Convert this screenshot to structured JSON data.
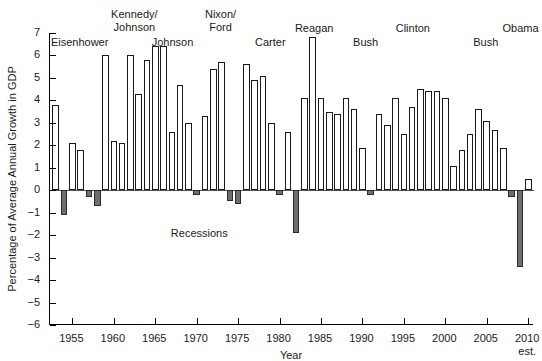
{
  "chart_data": {
    "type": "bar",
    "title": "",
    "xlabel": "Year",
    "ylabel": "Percentage of Average Annual Growth in GDP",
    "ylim": [
      -6,
      7
    ],
    "xlim": [
      1952.3,
      2010.7
    ],
    "yticks": [
      7,
      6,
      5,
      4,
      3,
      2,
      1,
      0,
      -1,
      -2,
      -3,
      -4,
      -5,
      -6
    ],
    "ytick_labels": [
      "7",
      "6",
      "5",
      "4",
      "3",
      "2",
      "1",
      "0",
      "−1",
      "−2",
      "−3",
      "−4",
      "−5",
      "−6"
    ],
    "xticks": [
      1955,
      1960,
      1965,
      1970,
      1975,
      1980,
      1985,
      1990,
      1995,
      2000,
      2005,
      2010
    ],
    "xtick_labels": [
      "1955",
      "1960",
      "1965",
      "1970",
      "1975",
      "1980",
      "1985",
      "1990",
      "1995",
      "2000",
      "2005",
      "2010"
    ],
    "xtick_sublabel": {
      "1955": "",
      "2010": "est."
    },
    "grid": false,
    "legend_position": "none",
    "bar_colors": {
      "positive": "#ffffff",
      "negative": "#6e6e6e",
      "outline": "#1a1a1a"
    },
    "categories": [
      1953,
      1954,
      1955,
      1956,
      1957,
      1958,
      1959,
      1960,
      1961,
      1962,
      1963,
      1964,
      1965,
      1966,
      1967,
      1968,
      1969,
      1970,
      1971,
      1972,
      1973,
      1974,
      1975,
      1976,
      1977,
      1978,
      1979,
      1980,
      1981,
      1982,
      1983,
      1984,
      1985,
      1986,
      1987,
      1988,
      1989,
      1990,
      1991,
      1992,
      1993,
      1994,
      1995,
      1996,
      1997,
      1998,
      1999,
      2000,
      2001,
      2002,
      2003,
      2004,
      2005,
      2006,
      2007,
      2008,
      2009,
      2010
    ],
    "values": [
      3.8,
      -1.1,
      2.1,
      1.8,
      -0.3,
      -0.7,
      6.0,
      2.2,
      2.1,
      6.0,
      4.3,
      5.8,
      6.4,
      6.4,
      2.6,
      4.7,
      3.0,
      -0.2,
      3.3,
      5.4,
      5.7,
      -0.5,
      -0.6,
      5.6,
      4.9,
      5.1,
      3.0,
      -0.2,
      2.6,
      -1.9,
      4.1,
      6.8,
      4.1,
      3.5,
      3.4,
      4.1,
      3.6,
      1.9,
      -0.2,
      3.4,
      2.9,
      4.1,
      2.5,
      3.7,
      4.5,
      4.4,
      4.4,
      4.1,
      1.1,
      1.8,
      2.5,
      3.6,
      3.1,
      2.7,
      1.9,
      -0.3,
      -3.4,
      0.5
    ],
    "recession_years": [
      1954,
      1958,
      1970,
      1974,
      1975,
      1980,
      1982,
      1991,
      2008,
      2009
    ],
    "recession_annotation": "Recessions",
    "era_labels": [
      {
        "text_lines": [
          "Eisenhower"
        ],
        "center_year": 1956.0,
        "top_px": 36
      },
      {
        "text_lines": [
          "Kennedy/",
          "Johnson"
        ],
        "center_year": 1962.6,
        "top_px": 8
      },
      {
        "text_lines": [
          "Johnson"
        ],
        "center_year": 1967.2,
        "top_px": 36
      },
      {
        "text_lines": [
          "Nixon/",
          "Ford"
        ],
        "center_year": 1973.0,
        "top_px": 8
      },
      {
        "text_lines": [
          "Carter"
        ],
        "center_year": 1979.0,
        "top_px": 36
      },
      {
        "text_lines": [
          "Reagan"
        ],
        "center_year": 1984.3,
        "top_px": 22
      },
      {
        "text_lines": [
          "Bush"
        ],
        "center_year": 1990.5,
        "top_px": 36
      },
      {
        "text_lines": [
          "Clinton"
        ],
        "center_year": 1996.2,
        "top_px": 22
      },
      {
        "text_lines": [
          "Bush"
        ],
        "center_year": 2005.0,
        "top_px": 36
      },
      {
        "text_lines": [
          "Obama"
        ],
        "center_year": 2009.2,
        "top_px": 22
      }
    ]
  }
}
